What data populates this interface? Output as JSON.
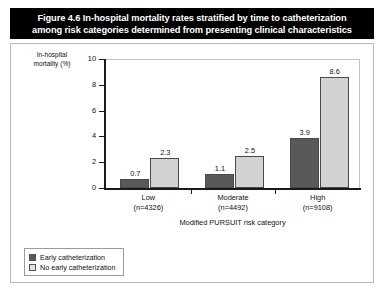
{
  "figure": {
    "title_line1": "Figure 4.6 In-hospital mortality rates stratified by time to catheterization",
    "title_line2": "among risk categories determined from presenting clinical characteristics"
  },
  "axis": {
    "y_label_line1": "In-hospital",
    "y_label_line2": "mortality (%)",
    "x_title": "Modified PURSUIT risk category"
  },
  "legend": {
    "items": [
      {
        "label": "Early catheterization",
        "color": "#595959"
      },
      {
        "label": "No early catheterization",
        "color": "#e2e2e2"
      }
    ]
  },
  "chart_data": {
    "type": "bar",
    "title": "Figure 4.6 In-hospital mortality rates stratified by time to catheterization among risk categories determined from presenting clinical characteristics",
    "xlabel": "Modified PURSUIT risk category",
    "ylabel": "In-hospital mortality (%)",
    "ylim": [
      0,
      10
    ],
    "yticks": [
      0,
      2,
      4,
      6,
      8,
      10
    ],
    "grid": false,
    "legend_position": "below-left",
    "categories": [
      "Low",
      "Moderate",
      "High"
    ],
    "category_sublabels": [
      "(n=4326)",
      "(n=4492)",
      "(n=9108)"
    ],
    "series": [
      {
        "name": "Early catheterization",
        "color": "#595959",
        "values": [
          0.7,
          1.1,
          3.9
        ]
      },
      {
        "name": "No early catheterization",
        "color": "#d2d2d2",
        "values": [
          2.3,
          2.5,
          8.6
        ]
      }
    ]
  }
}
